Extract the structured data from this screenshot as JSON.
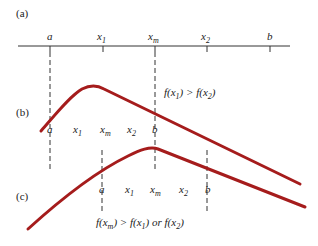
{
  "panels": {
    "a": {
      "label": "(a)",
      "points": [
        {
          "name": "a",
          "text": "a",
          "sub": ""
        },
        {
          "name": "x1",
          "text": "x",
          "sub": "1"
        },
        {
          "name": "xm",
          "text": "x",
          "sub": "m"
        },
        {
          "name": "x2",
          "text": "x",
          "sub": "2"
        },
        {
          "name": "b",
          "text": "b",
          "sub": ""
        }
      ]
    },
    "b": {
      "label": "(b)",
      "condition": {
        "f1": "f(x",
        "s1": "1",
        "mid": ") > f(x",
        "s2": "2",
        "end": ")"
      },
      "points": [
        {
          "text": "a",
          "sub": ""
        },
        {
          "text": "x",
          "sub": "1"
        },
        {
          "text": "x",
          "sub": "m"
        },
        {
          "text": "x",
          "sub": "2"
        },
        {
          "text": "b",
          "sub": ""
        }
      ]
    },
    "c": {
      "label": "(c)",
      "condition": {
        "f1": "f(x",
        "s1": "m",
        "mid": ") > f(x",
        "s2": "1",
        "or": ") or f(x",
        "s3": "2",
        "end": ")"
      },
      "points": [
        {
          "text": "a",
          "sub": ""
        },
        {
          "text": "x",
          "sub": "1"
        },
        {
          "text": "x",
          "sub": "m"
        },
        {
          "text": "x",
          "sub": "2"
        },
        {
          "text": "b",
          "sub": ""
        }
      ]
    }
  },
  "colors": {
    "curve": "#a51c1c",
    "ink": "#222222"
  }
}
